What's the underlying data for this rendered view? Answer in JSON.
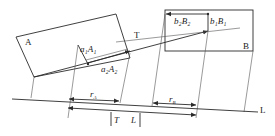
{
  "diagram": {
    "labels": {
      "block_a": "A",
      "block_b": "B",
      "line_t": "T",
      "line_l": "L",
      "a1A1": "a₁A₁",
      "a2A2": "a₂A₂",
      "b1B1": "b₁B₁",
      "b2B2": "b₂B₂",
      "rA": "r_A",
      "rB": "r_B",
      "rA_main": "r",
      "rA_sub": "A",
      "rB_main": "r",
      "rB_sub": "B",
      "T_bar": "T",
      "L_bar": "L"
    },
    "colors": {
      "line": "#2a2a2a",
      "background": "#ffffff"
    }
  }
}
